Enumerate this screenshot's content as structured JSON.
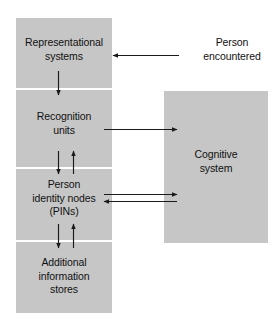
{
  "figure": {
    "background_color": "#ffffff",
    "box_fill_color": "#c6c6c6",
    "line_color": "#1a1a1a"
  },
  "left_column": {
    "name": "face-processing-stages",
    "stages": [
      {
        "id": "representational",
        "label": "Representational\nsystems"
      },
      {
        "id": "recognition",
        "label": "Recognition\nunits"
      },
      {
        "id": "pins",
        "label": "Person\nidentity nodes\n(PINs)"
      },
      {
        "id": "additional",
        "label": "Additional\ninformation\nstores"
      }
    ]
  },
  "right_box": {
    "id": "cognitive",
    "label": "Cognitive\nsystem"
  },
  "external_input": {
    "id": "person-encountered",
    "label": "Person\nencountered"
  },
  "connections": [
    {
      "id": "person-to-representational",
      "from": "person-encountered",
      "to": "representational",
      "direction": "left",
      "orientation": "horizontal"
    },
    {
      "id": "representational-to-recognition",
      "from": "representational",
      "to": "recognition",
      "direction": "down",
      "orientation": "vertical"
    },
    {
      "id": "recognition-to-cognitive",
      "from": "recognition",
      "to": "cognitive",
      "direction": "right",
      "orientation": "horizontal"
    },
    {
      "id": "recognition-to-pins",
      "from": "recognition",
      "to": "pins",
      "direction": "down",
      "orientation": "vertical"
    },
    {
      "id": "pins-to-recognition",
      "from": "pins",
      "to": "recognition",
      "direction": "up",
      "orientation": "vertical"
    },
    {
      "id": "pins-to-cognitive",
      "from": "pins",
      "to": "cognitive",
      "direction": "right",
      "orientation": "horizontal"
    },
    {
      "id": "cognitive-to-pins",
      "from": "cognitive",
      "to": "pins",
      "direction": "left",
      "orientation": "horizontal"
    },
    {
      "id": "pins-to-additional",
      "from": "pins",
      "to": "additional",
      "direction": "down",
      "orientation": "vertical"
    },
    {
      "id": "additional-to-pins",
      "from": "additional",
      "to": "pins",
      "direction": "up",
      "orientation": "vertical"
    }
  ]
}
